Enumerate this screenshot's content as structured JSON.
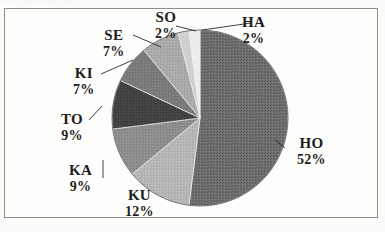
{
  "figure": {
    "frame_border_color": "#8d8d8a",
    "background_color": "#fdfdfb",
    "top_artifact_text": "··   ···     ····  ·····  ··· ··"
  },
  "chart_data": {
    "type": "pie",
    "title": "",
    "xlabel": "",
    "ylabel": "",
    "legend_position": "none",
    "grid": false,
    "labels_show_percent": true,
    "start_angle_deg": 0,
    "direction": "clockwise",
    "center": {
      "x": 200,
      "y": 118
    },
    "radius": 88,
    "categories": [
      "HO",
      "KU",
      "KA",
      "TO",
      "KI",
      "SE",
      "SO",
      "HA"
    ],
    "values": [
      52,
      12,
      9,
      9,
      7,
      7,
      2,
      2
    ],
    "slices": [
      {
        "label": "HO",
        "percent": 52,
        "percent_text": "52%",
        "color": "#6a6a6a"
      },
      {
        "label": "KU",
        "percent": 12,
        "percent_text": "12%",
        "color": "#b4b4b4"
      },
      {
        "label": "KA",
        "percent": 9,
        "percent_text": "9%",
        "color": "#8c8c8c"
      },
      {
        "label": "TO",
        "percent": 9,
        "percent_text": "9%",
        "color": "#3f3f3f"
      },
      {
        "label": "KI",
        "percent": 7,
        "percent_text": "7%",
        "color": "#787878"
      },
      {
        "label": "SE",
        "percent": 7,
        "percent_text": "7%",
        "color": "#a8a8a8"
      },
      {
        "label": "SO",
        "percent": 2,
        "percent_text": "2%",
        "color": "#cfcfcf"
      },
      {
        "label": "HA",
        "percent": 2,
        "percent_text": "2%",
        "color": "#ededed"
      }
    ]
  }
}
